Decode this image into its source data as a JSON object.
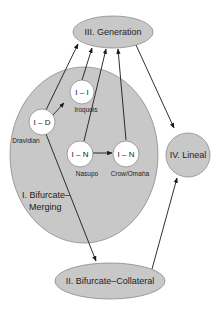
{
  "colors": {
    "region_fill": "#c8c8c8",
    "region_stroke": "#8a8a8a",
    "node_fill": "#ffffff",
    "arrow": "#1a1a1a",
    "background": "#ffffff"
  },
  "regions": {
    "generation": {
      "label": "III. Generation"
    },
    "bifurcate_merging": {
      "label_line1": "I. Bifurcate–",
      "label_line2": "Merging"
    },
    "lineal": {
      "label": "IV. Lineal"
    },
    "bifurcate_collateral": {
      "label": "II. Bifurcate–Collateral"
    }
  },
  "nodes": {
    "dravidian": {
      "label": "I – D",
      "caption": "Dravidian"
    },
    "iroquois": {
      "label": "I – I",
      "caption": "Iroquois"
    },
    "nasupo": {
      "label": "I – N",
      "caption": "Nasupo"
    },
    "crow_omaha": {
      "label": "I – N",
      "caption": "Crow/Omaha"
    }
  },
  "edges": [
    {
      "from": "I – D (Dravidian)",
      "to": "III. Generation"
    },
    {
      "from": "I – D (Dravidian)",
      "to": "I – I (Iroquois)"
    },
    {
      "from": "I – D (Dravidian)",
      "to": "II. Bifurcate–Collateral"
    },
    {
      "from": "I – I (Iroquois)",
      "to": "III. Generation"
    },
    {
      "from": "I – N (Nasupo)",
      "to": "III. Generation"
    },
    {
      "from": "I – N (Nasupo)",
      "to": "I – N (Crow/Omaha)"
    },
    {
      "from": "I – N (Crow/Omaha)",
      "to": "III. Generation"
    },
    {
      "from": "III. Generation",
      "to": "IV. Lineal"
    },
    {
      "from": "II. Bifurcate–Collateral",
      "to": "IV. Lineal"
    }
  ]
}
